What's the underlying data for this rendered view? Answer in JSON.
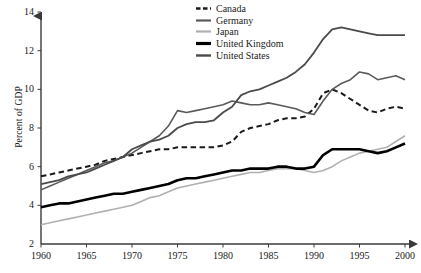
{
  "chart_data": {
    "type": "line",
    "title": "",
    "xlabel": "",
    "ylabel": "Percent of GDP",
    "xlim": [
      1960,
      2000
    ],
    "ylim": [
      2,
      14
    ],
    "xticks": [
      1960,
      1965,
      1970,
      1975,
      1980,
      1985,
      1990,
      1995,
      2000
    ],
    "yticks": [
      2,
      4,
      6,
      8,
      10,
      12,
      14
    ],
    "grid": false,
    "legend_position": "top-center-right",
    "x": [
      1960,
      1961,
      1962,
      1963,
      1964,
      1965,
      1966,
      1967,
      1968,
      1969,
      1970,
      1971,
      1972,
      1973,
      1974,
      1975,
      1976,
      1977,
      1978,
      1979,
      1980,
      1981,
      1982,
      1983,
      1984,
      1985,
      1986,
      1987,
      1988,
      1989,
      1990,
      1991,
      1992,
      1993,
      1994,
      1995,
      1996,
      1997,
      1998,
      1999,
      2000
    ],
    "series": [
      {
        "name": "Canada",
        "color": "#1a1a1a",
        "style": "dashed",
        "width": 2.0,
        "values": [
          5.5,
          5.6,
          5.7,
          5.8,
          5.9,
          6.0,
          6.1,
          6.3,
          6.4,
          6.5,
          6.6,
          6.7,
          6.8,
          6.9,
          6.9,
          7.0,
          7.0,
          7.0,
          7.0,
          7.0,
          7.1,
          7.3,
          7.8,
          8.0,
          8.1,
          8.2,
          8.4,
          8.5,
          8.5,
          8.6,
          9.0,
          9.8,
          10.0,
          9.8,
          9.5,
          9.2,
          8.9,
          8.8,
          9.0,
          9.1,
          9.0
        ]
      },
      {
        "name": "Germany",
        "color": "#5a5a5a",
        "style": "solid",
        "width": 1.6,
        "values": [
          4.8,
          5.0,
          5.2,
          5.4,
          5.6,
          5.8,
          6.0,
          6.2,
          6.3,
          6.5,
          6.7,
          7.0,
          7.3,
          7.6,
          8.1,
          8.9,
          8.8,
          8.9,
          9.0,
          9.1,
          9.2,
          9.4,
          9.3,
          9.2,
          9.2,
          9.3,
          9.2,
          9.1,
          9.0,
          8.8,
          8.7,
          9.4,
          10.0,
          10.3,
          10.5,
          10.9,
          10.8,
          10.5,
          10.6,
          10.7,
          10.5
        ]
      },
      {
        "name": "Japan",
        "color": "#b0b0b0",
        "style": "solid",
        "width": 1.6,
        "values": [
          3.0,
          3.1,
          3.2,
          3.3,
          3.4,
          3.5,
          3.6,
          3.7,
          3.8,
          3.9,
          4.0,
          4.2,
          4.4,
          4.5,
          4.7,
          4.9,
          5.0,
          5.1,
          5.2,
          5.3,
          5.4,
          5.5,
          5.6,
          5.7,
          5.7,
          5.8,
          5.9,
          5.9,
          5.9,
          5.8,
          5.7,
          5.8,
          6.0,
          6.3,
          6.5,
          6.7,
          6.8,
          6.9,
          7.0,
          7.3,
          7.6
        ]
      },
      {
        "name": "United Kingdom",
        "color": "#000000",
        "style": "solid",
        "width": 2.6,
        "values": [
          3.9,
          4.0,
          4.1,
          4.1,
          4.2,
          4.3,
          4.4,
          4.5,
          4.6,
          4.6,
          4.7,
          4.8,
          4.9,
          5.0,
          5.1,
          5.3,
          5.4,
          5.4,
          5.5,
          5.6,
          5.7,
          5.8,
          5.8,
          5.9,
          5.9,
          5.9,
          6.0,
          6.0,
          5.9,
          5.9,
          6.0,
          6.6,
          6.9,
          6.9,
          6.9,
          6.9,
          6.8,
          6.7,
          6.8,
          7.0,
          7.2
        ]
      },
      {
        "name": "United States",
        "color": "#4a4a4a",
        "style": "solid",
        "width": 1.8,
        "values": [
          5.1,
          5.2,
          5.3,
          5.5,
          5.6,
          5.7,
          5.9,
          6.1,
          6.3,
          6.5,
          6.9,
          7.1,
          7.3,
          7.4,
          7.6,
          8.0,
          8.2,
          8.3,
          8.3,
          8.4,
          8.8,
          9.1,
          9.7,
          9.9,
          10.0,
          10.2,
          10.4,
          10.6,
          10.9,
          11.3,
          11.9,
          12.6,
          13.1,
          13.2,
          13.1,
          13.0,
          12.9,
          12.8,
          12.8,
          12.8,
          12.8
        ]
      }
    ]
  },
  "legend": {
    "entries": [
      {
        "label": "Canada"
      },
      {
        "label": "Germany"
      },
      {
        "label": "Japan"
      },
      {
        "label": "United Kingdom"
      },
      {
        "label": "United States"
      }
    ]
  }
}
